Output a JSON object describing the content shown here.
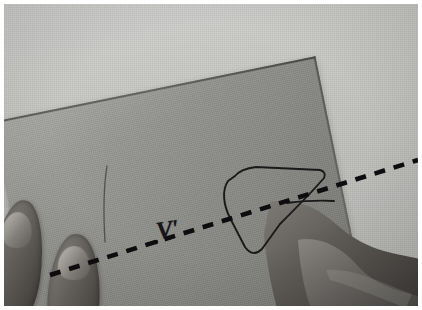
{
  "image": {
    "kind": "photograph",
    "palette": "grayscale",
    "width": 422,
    "height": 310,
    "border_color": "#ffffff",
    "background_color": "#c9c9c7",
    "paper_color": "#8e8e8a",
    "ink_color": "#15151a",
    "skin_color": "#6e6b66"
  },
  "scene": {
    "description": "Two hands holding a tilted sheet of paper on a light gray surface",
    "subject": "paper-sheet",
    "annotations": {
      "label": "V'"
    }
  },
  "elements": {
    "background_name": "table-surface",
    "paper_name": "paper-sheet",
    "left_hand_name": "left-hand",
    "right_hand_name": "right-hand",
    "dashed_line_name": "dashed-cut-line",
    "shape_name": "drawn-closed-curve",
    "faint_line_name": "faint-pencil-line",
    "label_name": "v-prime-label"
  }
}
